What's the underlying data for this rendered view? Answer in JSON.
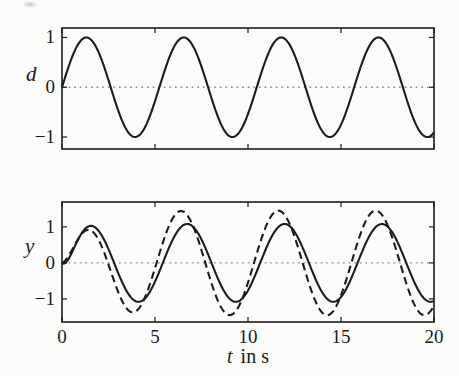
{
  "theme": {
    "paper_color": "#fbfbf9",
    "ink_color": "#1c1c1c",
    "zero_line_color": "#8c8c8c"
  },
  "chart_data": [
    {
      "type": "line",
      "subplot": "top",
      "ylabel": "d",
      "xlabel": "",
      "xlim": [
        0,
        20
      ],
      "ylim": [
        -1.24,
        1.19
      ],
      "xticks": [
        0,
        5,
        10,
        15,
        20
      ],
      "xtick_labels": [
        "0",
        "5",
        "10",
        "15",
        "20"
      ],
      "xtick_labels_shown": false,
      "yticks": [
        -1,
        0,
        1
      ],
      "ytick_labels": [
        "−1",
        "0",
        "1"
      ],
      "grid": "off",
      "zero_line_style": "dotted",
      "legend": "none",
      "series": [
        {
          "name": "d",
          "description": "sinusoidal disturbance d(t) = sin(1.2 t)",
          "line_style": "solid",
          "model": {
            "kind": "sine_with_rise",
            "amplitude": 1.0,
            "omega_rad_per_s": 1.2,
            "phase_rad": 0,
            "rise_time_constant_s": 0
          },
          "keypoints_t_y": [
            [
              0,
              0
            ],
            [
              1.31,
              1.0
            ],
            [
              2.62,
              0
            ],
            [
              3.93,
              -1.0
            ],
            [
              5.24,
              0
            ],
            [
              6.54,
              1.0
            ],
            [
              7.85,
              0
            ],
            [
              9.16,
              -1.0
            ],
            [
              10.47,
              0
            ],
            [
              11.78,
              1.0
            ],
            [
              13.09,
              0
            ],
            [
              14.4,
              -1.0
            ],
            [
              15.71,
              0
            ],
            [
              17.02,
              1.0
            ],
            [
              18.33,
              0
            ],
            [
              19.63,
              -1.0
            ],
            [
              20,
              -0.91
            ]
          ]
        }
      ]
    },
    {
      "type": "line",
      "subplot": "bottom",
      "ylabel": "y",
      "xlabel": "t in s",
      "xlabel_var": "t",
      "xlabel_unit": "in s",
      "xlim": [
        0,
        20
      ],
      "ylim": [
        -1.64,
        1.69
      ],
      "xticks": [
        0,
        5,
        10,
        15,
        20
      ],
      "xtick_labels": [
        "0",
        "5",
        "10",
        "15",
        "20"
      ],
      "xtick_labels_shown": true,
      "yticks": [
        -1,
        0,
        1
      ],
      "ytick_labels": [
        "−1",
        "0",
        "1"
      ],
      "grid": "off",
      "zero_line_style": "dotted",
      "legend": "none",
      "series": [
        {
          "name": "y-solid",
          "description": "output response, solid line; settles to amplitude 1.08 with slight phase lag",
          "line_style": "solid",
          "model": {
            "kind": "sine_with_rise",
            "amplitude": 1.08,
            "omega_rad_per_s": 1.2,
            "phase_rad": -0.22,
            "rise_time_constant_s": 0.5
          },
          "keypoints_t_y": [
            [
              0,
              0
            ],
            [
              1.49,
              1.03
            ],
            [
              2.8,
              0
            ],
            [
              4.12,
              -1.08
            ],
            [
              5.43,
              0
            ],
            [
              6.73,
              1.08
            ],
            [
              8.04,
              0
            ],
            [
              9.36,
              -1.08
            ],
            [
              10.67,
              0
            ],
            [
              11.97,
              1.08
            ],
            [
              13.28,
              0
            ],
            [
              14.59,
              -1.08
            ],
            [
              15.9,
              0
            ],
            [
              17.21,
              1.08
            ],
            [
              18.52,
              0
            ],
            [
              19.83,
              -1.08
            ],
            [
              20,
              -1.06
            ]
          ]
        },
        {
          "name": "y-dashed",
          "description": "output response, dashed line; grows from rest to amplitude 1.45 with slight phase lead",
          "line_style": "dashed",
          "model": {
            "kind": "sine_with_rise",
            "amplitude": 1.45,
            "omega_rad_per_s": 1.2,
            "phase_rad": 0.18,
            "rise_time_constant_s": 1.3
          },
          "keypoints_t_y": [
            [
              0,
              0
            ],
            [
              1.16,
              0.86
            ],
            [
              2.47,
              0
            ],
            [
              3.78,
              -1.37
            ],
            [
              5.09,
              0
            ],
            [
              6.4,
              1.44
            ],
            [
              7.71,
              0
            ],
            [
              9.02,
              -1.45
            ],
            [
              10.33,
              0
            ],
            [
              11.63,
              1.45
            ],
            [
              12.94,
              0
            ],
            [
              14.25,
              -1.45
            ],
            [
              15.56,
              0
            ],
            [
              16.87,
              1.45
            ],
            [
              18.18,
              0
            ],
            [
              19.49,
              -1.45
            ],
            [
              20,
              -1.19
            ]
          ]
        }
      ]
    }
  ]
}
